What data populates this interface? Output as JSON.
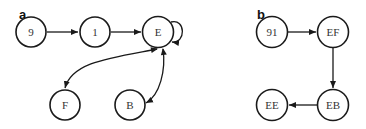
{
  "panels": [
    {
      "label": "a",
      "nodes": [
        {
          "id": "9",
          "label": "9"
        },
        {
          "id": "1",
          "label": "1"
        },
        {
          "id": "E",
          "label": "E"
        },
        {
          "id": "F",
          "label": "F"
        },
        {
          "id": "B",
          "label": "B"
        }
      ],
      "edges": [
        {
          "from": "9",
          "to": "1",
          "type": "directed"
        },
        {
          "from": "1",
          "to": "E",
          "type": "directed"
        },
        {
          "from": "E",
          "to": "E",
          "type": "self-loop"
        },
        {
          "from": "E",
          "to": "F",
          "type": "bidirectional"
        },
        {
          "from": "E",
          "to": "B",
          "type": "bidirectional"
        }
      ]
    },
    {
      "label": "b",
      "nodes": [
        {
          "id": "91",
          "label": "91"
        },
        {
          "id": "EF",
          "label": "EF"
        },
        {
          "id": "EB",
          "label": "EB"
        },
        {
          "id": "EE",
          "label": "EE"
        }
      ],
      "edges": [
        {
          "from": "91",
          "to": "EF",
          "type": "directed"
        },
        {
          "from": "EF",
          "to": "EB",
          "type": "directed"
        },
        {
          "from": "EB",
          "to": "EE",
          "type": "directed"
        }
      ]
    }
  ]
}
